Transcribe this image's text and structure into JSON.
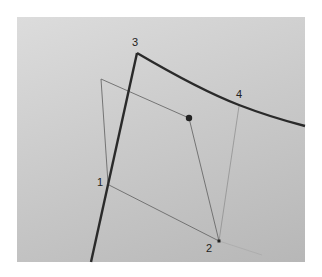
{
  "diagram": {
    "colors": {
      "background": "#ffffff",
      "panel_light": "#dcdcdc",
      "panel_dark": "#b7b7b7",
      "thick_line": "#2a2a2a",
      "thin_line": "#6a6a6a",
      "faint_line": "#8a8a8a"
    },
    "points": [
      {
        "id": "1",
        "label": "1",
        "x": 108,
        "y": 184,
        "label_x": 97,
        "label_y": 186
      },
      {
        "id": "2",
        "label": "2",
        "x": 219,
        "y": 241,
        "label_x": 206,
        "label_y": 252
      },
      {
        "id": "3",
        "label": "3",
        "x": 137,
        "y": 53,
        "label_x": 132,
        "label_y": 46
      },
      {
        "id": "4",
        "label": "4",
        "x": 239,
        "y": 105,
        "label_x": 236,
        "label_y": 98
      }
    ],
    "center_dot": {
      "x": 189,
      "y": 118
    },
    "quad_top_left": {
      "x": 101,
      "y": 79
    }
  }
}
